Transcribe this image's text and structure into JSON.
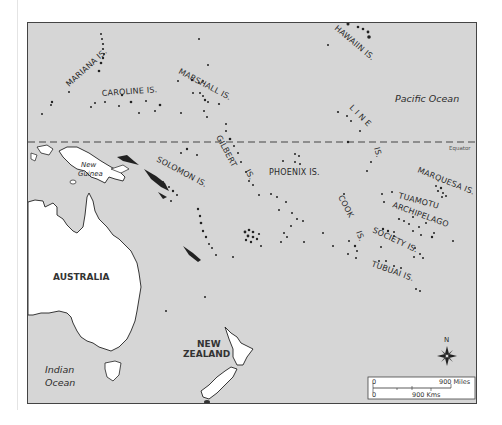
{
  "map": {
    "background_color": "#d6d6d6",
    "land_color": "#ffffff",
    "border_color": "#444444",
    "island_groups": [
      {
        "id": "mariana",
        "label": "MARIANA IS."
      },
      {
        "id": "caroline",
        "label": "CAROLINE IS."
      },
      {
        "id": "marshall",
        "label": "MARSHALL IS."
      },
      {
        "id": "hawaiian",
        "label": "HAWAIIN IS."
      },
      {
        "id": "line",
        "label": "L I N E"
      },
      {
        "id": "line_is",
        "label": "IS."
      },
      {
        "id": "gilbert",
        "label": "GILBERT"
      },
      {
        "id": "gilbert_is",
        "label": "IS."
      },
      {
        "id": "solomon",
        "label": "SOLOMON IS."
      },
      {
        "id": "phoenix",
        "label": "PHOENIX IS."
      },
      {
        "id": "cook",
        "label": "COOK"
      },
      {
        "id": "cook_is",
        "label": "IS."
      },
      {
        "id": "marquesa",
        "label": "MARQUESA IS."
      },
      {
        "id": "tuamotu",
        "label": "TUAMOTU"
      },
      {
        "id": "archipelago",
        "label": "ARCHIPELAGO"
      },
      {
        "id": "society",
        "label": "SOCIETY IS."
      },
      {
        "id": "tubuai",
        "label": "TUBUAI IS."
      }
    ],
    "landmasses": {
      "new_guinea_line1": "New",
      "new_guinea_line2": "Guinea",
      "australia": "AUSTRALIA",
      "new_zealand_line1": "NEW",
      "new_zealand_line2": "ZEALAND"
    },
    "oceans": {
      "pacific": "Pacific Ocean",
      "indian_line1": "Indian",
      "indian_line2": "Ocean"
    },
    "equator_label": "Equator",
    "compass": {
      "north_label": "N"
    },
    "scale": {
      "miles_start": "0",
      "miles_end": "900 Miles",
      "kms_start": "0",
      "kms_end": "900 Kms"
    }
  }
}
